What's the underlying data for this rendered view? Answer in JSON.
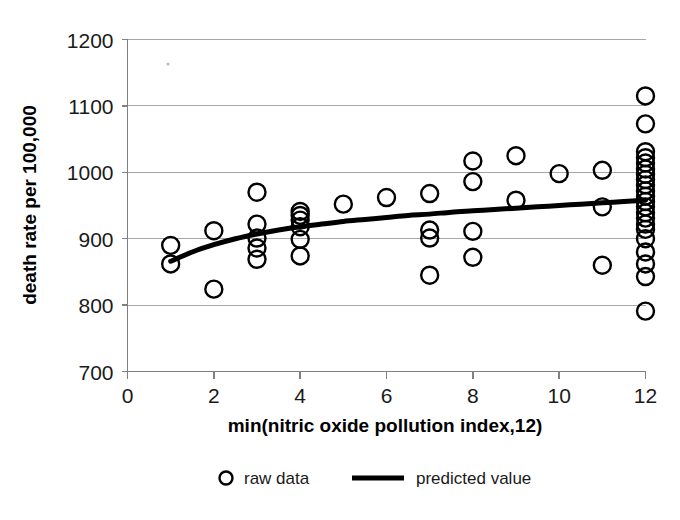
{
  "chart_data": {
    "type": "scatter",
    "title": "",
    "xlabel": "min(nitric oxide pollution index,12)",
    "ylabel": "death rate per 100,000",
    "xlim": [
      0,
      12
    ],
    "ylim": [
      700,
      1200
    ],
    "xticks": [
      0,
      2,
      4,
      6,
      8,
      10,
      12
    ],
    "yticks": [
      700,
      800,
      900,
      1000,
      1100,
      1200
    ],
    "xtick_labels": [
      "0",
      "2",
      "4",
      "6",
      "8",
      "10",
      "12"
    ],
    "ytick_labels": [
      "700",
      "800",
      "900",
      "1000",
      "1100",
      "1200"
    ],
    "grid": "horizontal",
    "legend_position": "bottom",
    "series": [
      {
        "name": "raw data",
        "type": "scatter",
        "marker": "open-circle",
        "color": "#000000",
        "points": [
          [
            1,
            890
          ],
          [
            1,
            862
          ],
          [
            2,
            912
          ],
          [
            2,
            824
          ],
          [
            3,
            970
          ],
          [
            3,
            922
          ],
          [
            3,
            901
          ],
          [
            3,
            886
          ],
          [
            3,
            869
          ],
          [
            4,
            941
          ],
          [
            4,
            935
          ],
          [
            4,
            928
          ],
          [
            4,
            918
          ],
          [
            4,
            899
          ],
          [
            4,
            874
          ],
          [
            5,
            952
          ],
          [
            6,
            962
          ],
          [
            7,
            968
          ],
          [
            7,
            913
          ],
          [
            7,
            901
          ],
          [
            7,
            845
          ],
          [
            8,
            1017
          ],
          [
            8,
            986
          ],
          [
            8,
            911
          ],
          [
            8,
            872
          ],
          [
            9,
            1025
          ],
          [
            9,
            958
          ],
          [
            10,
            998
          ],
          [
            11,
            1003
          ],
          [
            11,
            948
          ],
          [
            11,
            860
          ],
          [
            12,
            1115
          ],
          [
            12,
            1073
          ],
          [
            12,
            1031
          ],
          [
            12,
            1022
          ],
          [
            12,
            1014
          ],
          [
            12,
            1005
          ],
          [
            12,
            997
          ],
          [
            12,
            989
          ],
          [
            12,
            981
          ],
          [
            12,
            972
          ],
          [
            12,
            964
          ],
          [
            12,
            956
          ],
          [
            12,
            948
          ],
          [
            12,
            939
          ],
          [
            12,
            931
          ],
          [
            12,
            922
          ],
          [
            12,
            914
          ],
          [
            12,
            900
          ],
          [
            12,
            880
          ],
          [
            12,
            862
          ],
          [
            12,
            843
          ],
          [
            12,
            791
          ]
        ]
      },
      {
        "name": "predicted value",
        "type": "line",
        "color": "#000000",
        "points": [
          [
            1,
            866
          ],
          [
            1.5,
            880
          ],
          [
            2,
            891
          ],
          [
            2.5,
            900
          ],
          [
            3,
            907
          ],
          [
            3.5,
            913
          ],
          [
            4,
            918
          ],
          [
            4.5,
            922
          ],
          [
            5,
            926
          ],
          [
            5.5,
            929
          ],
          [
            6,
            932
          ],
          [
            6.5,
            935
          ],
          [
            7,
            937
          ],
          [
            7.5,
            940
          ],
          [
            8,
            942
          ],
          [
            8.5,
            944
          ],
          [
            9,
            946
          ],
          [
            9.5,
            948
          ],
          [
            10,
            950
          ],
          [
            10.5,
            952
          ],
          [
            11,
            954
          ],
          [
            11.5,
            956
          ],
          [
            12,
            958
          ]
        ]
      }
    ]
  },
  "legend": {
    "entries": [
      {
        "label": "raw data",
        "marker": "open-circle"
      },
      {
        "label": "predicted value",
        "marker": "line"
      }
    ]
  },
  "axes": {
    "x_title": "min(nitric oxide pollution index,12)",
    "y_title": "death rate per 100,000"
  }
}
